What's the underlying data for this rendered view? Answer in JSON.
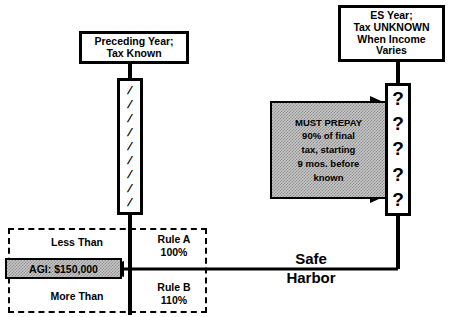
{
  "diagram": {
    "colors": {
      "ink": "#000000",
      "fill_gray": "#c9c9c9",
      "page": "#ffffff"
    },
    "preceding_year_box": {
      "line1": "Preceding Year;",
      "line2": "Tax Known"
    },
    "es_year_box": {
      "line1": "ES Year;",
      "line2": "Tax UNKNOWN",
      "line3": "When Income",
      "line4": "Varies"
    },
    "known_bar": {
      "name": "known-tax-timeline-bar",
      "slash_glyph": "/",
      "slash_count": 9
    },
    "unknown_bar": {
      "name": "unknown-tax-timeline-bar",
      "marks": [
        "?",
        "?",
        "?",
        "?",
        "?"
      ]
    },
    "prepay_box": {
      "line1": "MUST PREPAY",
      "line2": "90% of final",
      "line3": "tax, starting",
      "line4": "9 mos. before",
      "line5": "known"
    },
    "agi_region": {
      "less_than": "Less Than",
      "more_than": "More Than",
      "agi_threshold": "AGI: $150,000",
      "rule_a_name": "Rule A",
      "rule_a_pct": "100%",
      "rule_b_name": "Rule B",
      "rule_b_pct": "110%"
    },
    "safe_harbor": {
      "line1": "Safe",
      "line2": "Harbor"
    }
  }
}
